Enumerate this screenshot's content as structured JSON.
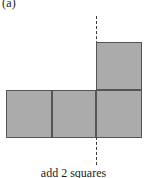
{
  "figure": {
    "panel_label": "(a)",
    "caption": "add 2 squares",
    "colors": {
      "square_fill": "#ababab",
      "square_border": "#555555",
      "axis_line": "#3a3a3a",
      "background": "#ffffff",
      "text": "#1c1c1c"
    },
    "axis": {
      "name": "vertical-dashed-symmetry-line",
      "style": "dashed",
      "x": 96,
      "y_top": 16,
      "y_bottom": 165
    },
    "squares": [
      {
        "name": "bottom-row-square-left",
        "x": 6,
        "y": 90,
        "w": 46,
        "h": 48
      },
      {
        "name": "bottom-row-square-middle",
        "x": 52,
        "y": 90,
        "w": 44,
        "h": 48
      },
      {
        "name": "bottom-row-square-right",
        "x": 96,
        "y": 90,
        "w": 46,
        "h": 48
      },
      {
        "name": "top-square-above-right",
        "x": 96,
        "y": 42,
        "w": 46,
        "h": 48
      }
    ]
  }
}
